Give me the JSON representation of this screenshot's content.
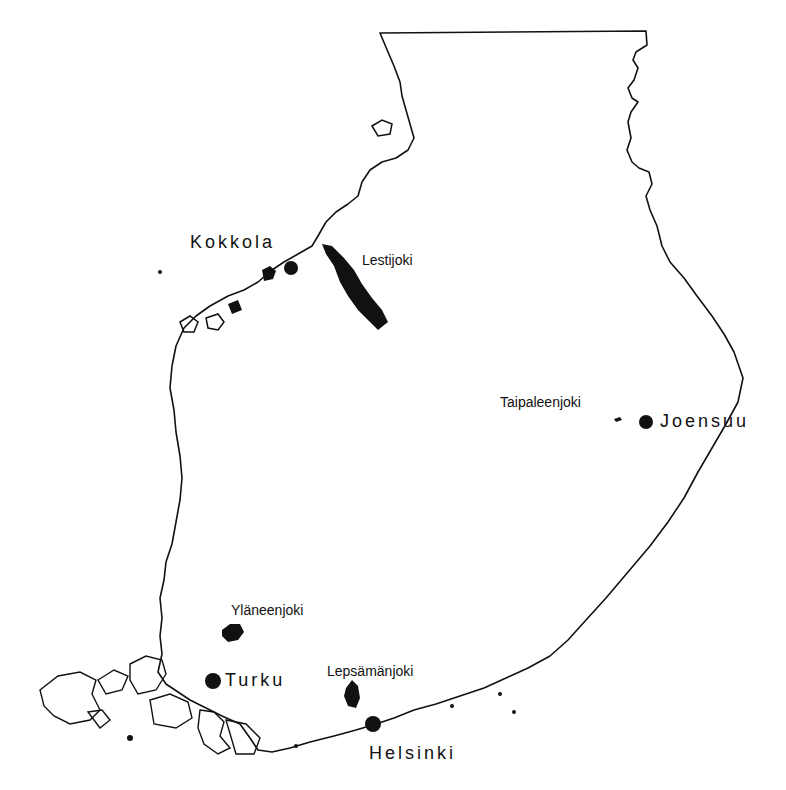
{
  "map": {
    "region": "Southern Finland",
    "colors": {
      "ink": "#111111",
      "background": "#ffffff"
    },
    "cities": [
      {
        "name": "Kokkola",
        "x": 291,
        "y": 268
      },
      {
        "name": "Joensuu",
        "x": 646,
        "y": 422
      },
      {
        "name": "Turku",
        "x": 213,
        "y": 681
      },
      {
        "name": "Helsinki",
        "x": 373,
        "y": 724
      }
    ],
    "rivers": [
      {
        "name": "Lestijoki"
      },
      {
        "name": "Taipaleenjoki"
      },
      {
        "name": "Yläneenjoki"
      },
      {
        "name": "Lepsämänjoki"
      }
    ]
  }
}
